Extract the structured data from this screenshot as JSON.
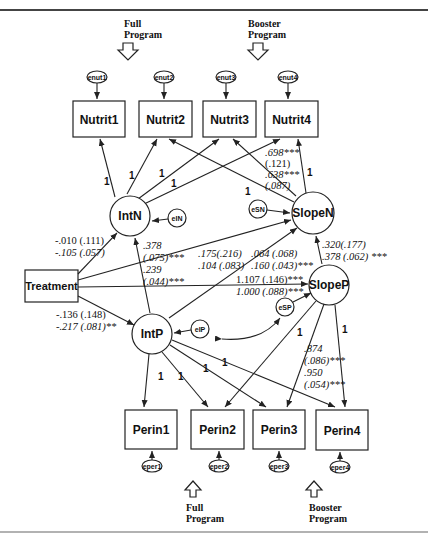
{
  "diagram": {
    "type": "structural-equation-model path diagram",
    "programs": {
      "top_full": "Full",
      "top_full_2": "Program",
      "top_booster": "Booster",
      "top_booster_2": "Program",
      "bottom_full": "Full",
      "bottom_full_2": "Program",
      "bottom_booster": "Booster",
      "bottom_booster_2": "Program"
    },
    "nutrit_errors": [
      "enut1",
      "enut2",
      "enut3",
      "enut4"
    ],
    "nutrit_boxes": [
      "Nutrit1",
      "Nutrit2",
      "Nutrit3",
      "Nutrit4"
    ],
    "perin_boxes": [
      "Perin1",
      "Perin2",
      "Perin3",
      "Perin4"
    ],
    "perin_errors": [
      "eper1",
      "eper2",
      "eper3",
      "eper4"
    ],
    "latent": {
      "intn": "IntN",
      "slopen": "SlopeN",
      "intp": "IntP",
      "slopep": "SlopeP",
      "ein": "eIN",
      "esn": "eSN",
      "eip": "eIP",
      "esp": "eSP"
    },
    "treatment": "Treatment",
    "loadings": {
      "one": "1"
    },
    "coefficients": {
      "treat_intn_1": "-.010 (.111)",
      "treat_intn_2": "-.105 (.057)",
      "treat_intp_1": "-.136 (.148)",
      "treat_intp_2": "-.217 (.081)**",
      "intp_intn_1": ".378",
      "intp_intn_2": "(.075)***",
      "intp_intn_3": ".239",
      "intp_intn_4": "(.044)***",
      "treat_slopen_1": ".175(.216)",
      "treat_slopen_2": ".104 (.083)",
      "intp_slopen_1": ".064 (.068)",
      "intp_slopen_2": ".160 (.043)***",
      "treat_slopep_1": "1.107 (.146)***",
      "treat_slopep_2": "1.000 (.088)***",
      "slopep_slopen_1": ".320(.177)",
      "slopep_slopen_2": ".378 (.062) ***",
      "slopen_nutrit3_1": ".698***",
      "slopen_nutrit3_2": "(.121)",
      "slopen_nutrit3_3": ".638***",
      "slopen_nutrit3_4": "(.087)",
      "slopep_perin3_1": ".874",
      "slopep_perin3_2": "(.086)***",
      "slopep_perin3_3": ".950",
      "slopep_perin3_4": "(.054)***"
    }
  }
}
